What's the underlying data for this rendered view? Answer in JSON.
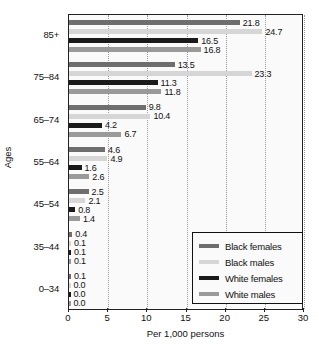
{
  "chart_data": {
    "type": "bar",
    "orientation": "horizontal",
    "title": "",
    "xlabel": "Per 1,000 persons",
    "ylabel": "Ages",
    "xlim": [
      0,
      30
    ],
    "xticks": [
      0,
      5,
      10,
      15,
      20,
      25,
      30
    ],
    "grid": true,
    "legend_position": "bottom-right",
    "categories": [
      "85+",
      "75–84",
      "65–74",
      "55–64",
      "45–54",
      "35–44",
      "0–34"
    ],
    "series": [
      {
        "name": "Black females",
        "color": "#6e6e6e",
        "values": [
          21.8,
          13.5,
          9.8,
          4.6,
          2.5,
          0.4,
          0.1
        ],
        "labels": [
          "21.8",
          "13.5",
          "9.8",
          "4.6",
          "2.5",
          "0.4",
          "0.1"
        ]
      },
      {
        "name": "Black males",
        "color": "#d6d6d6",
        "values": [
          24.7,
          23.3,
          10.4,
          4.9,
          2.1,
          0.1,
          0.0
        ],
        "labels": [
          "24.7",
          "23.3",
          "10.4",
          "4.9",
          "2.1",
          "0.1",
          "0.0"
        ]
      },
      {
        "name": "White females",
        "color": "#1a1a1a",
        "values": [
          16.5,
          11.3,
          4.2,
          1.6,
          0.8,
          0.1,
          0.0
        ],
        "labels": [
          "16.5",
          "11.3",
          "4.2",
          "1.6",
          "0.8",
          "0.1",
          "0.0"
        ]
      },
      {
        "name": "White males",
        "color": "#9a9a9a",
        "values": [
          16.8,
          11.8,
          6.7,
          2.6,
          1.4,
          0.1,
          0.0
        ],
        "labels": [
          "16.8",
          "11.8",
          "6.7",
          "2.6",
          "1.4",
          "0.1",
          "0.0"
        ]
      }
    ]
  },
  "legend": {
    "items": [
      {
        "label": "Black females",
        "color": "#6e6e6e"
      },
      {
        "label": "Black males",
        "color": "#d6d6d6"
      },
      {
        "label": "White females",
        "color": "#1a1a1a"
      },
      {
        "label": "White males",
        "color": "#9a9a9a"
      }
    ]
  },
  "axes": {
    "x_label": "Per 1,000 persons",
    "y_label": "Ages",
    "x_tick_labels": [
      "0",
      "5",
      "10",
      "15",
      "20",
      "25",
      "30"
    ],
    "y_tick_labels": [
      "85+",
      "75–84",
      "65–74",
      "55–64",
      "45–54",
      "35–44",
      "0–34"
    ]
  }
}
